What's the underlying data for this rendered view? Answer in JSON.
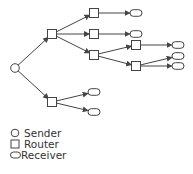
{
  "diagram": {
    "type": "multicast-tree",
    "colors": {
      "stroke": "#444444",
      "fill": "#ffffff"
    },
    "nodes": [
      {
        "id": "s",
        "kind": "sender",
        "x": 15,
        "y": 68
      },
      {
        "id": "r1",
        "kind": "router",
        "x": 52,
        "y": 34
      },
      {
        "id": "r2",
        "kind": "router",
        "x": 52,
        "y": 102
      },
      {
        "id": "r3",
        "kind": "router",
        "x": 94,
        "y": 13
      },
      {
        "id": "r4",
        "kind": "router",
        "x": 94,
        "y": 34
      },
      {
        "id": "r5",
        "kind": "router",
        "x": 94,
        "y": 55
      },
      {
        "id": "r6",
        "kind": "router",
        "x": 136,
        "y": 45
      },
      {
        "id": "r7",
        "kind": "router",
        "x": 136,
        "y": 66
      },
      {
        "id": "c1",
        "kind": "receiver",
        "x": 136,
        "y": 13
      },
      {
        "id": "c2",
        "kind": "receiver",
        "x": 136,
        "y": 34
      },
      {
        "id": "c3",
        "kind": "receiver",
        "x": 178,
        "y": 45
      },
      {
        "id": "c4",
        "kind": "receiver",
        "x": 178,
        "y": 56
      },
      {
        "id": "c5",
        "kind": "receiver",
        "x": 178,
        "y": 66
      },
      {
        "id": "c6",
        "kind": "receiver",
        "x": 94,
        "y": 92
      },
      {
        "id": "c7",
        "kind": "receiver",
        "x": 94,
        "y": 112
      }
    ],
    "edges": [
      [
        "s",
        "r1"
      ],
      [
        "s",
        "r2"
      ],
      [
        "r1",
        "r3"
      ],
      [
        "r1",
        "r4"
      ],
      [
        "r1",
        "r5"
      ],
      [
        "r3",
        "c1"
      ],
      [
        "r4",
        "c2"
      ],
      [
        "r5",
        "r6"
      ],
      [
        "r5",
        "r7"
      ],
      [
        "r6",
        "c3"
      ],
      [
        "r7",
        "c4"
      ],
      [
        "r7",
        "c5"
      ],
      [
        "r2",
        "c6"
      ],
      [
        "r2",
        "c7"
      ]
    ]
  },
  "legend": {
    "items": [
      {
        "symbol": "circle",
        "label": "Sender"
      },
      {
        "symbol": "square",
        "label": "Router"
      },
      {
        "symbol": "oval",
        "label": "Receiver"
      }
    ]
  }
}
